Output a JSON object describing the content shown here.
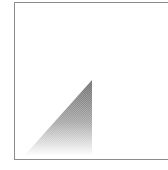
{
  "canvas": {
    "width": 168,
    "height": 170,
    "background": "#ffffff"
  },
  "frame": {
    "border_color": "#8c8c8c",
    "left": 14,
    "top": 2,
    "bottom": 160
  },
  "triangle": {
    "icon": "gradient-triangle-shape",
    "apex": [
      92,
      80
    ],
    "bottom_left": [
      24,
      156
    ],
    "bottom_right": [
      92,
      156
    ],
    "gradient_top_color": "#6e6e6e",
    "gradient_bottom_color": "#ffffff"
  }
}
